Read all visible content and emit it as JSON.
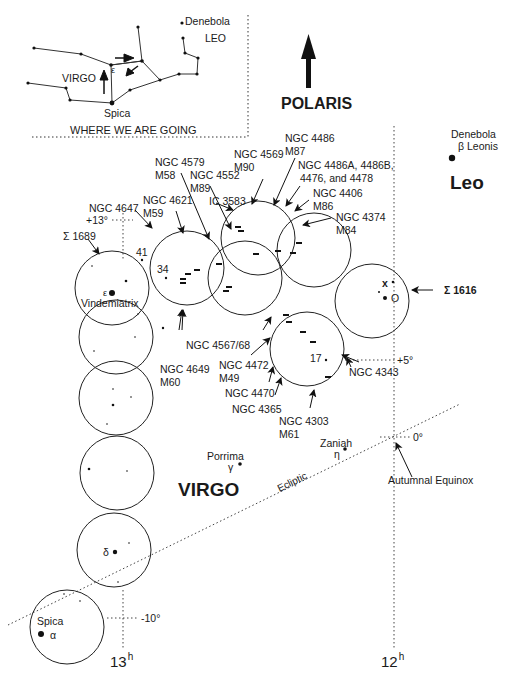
{
  "inset": {
    "title": "WHERE WE ARE GOING",
    "virgo_label": "VIRGO",
    "leo_label": "LEO",
    "denebola_label": "Denebola",
    "spica_label": "Spica",
    "epsilon_label": "ε"
  },
  "direction": {
    "label": "POLARIS"
  },
  "constellations": {
    "leo": "Leo",
    "virgo": "VIRGO"
  },
  "stars": {
    "denebola": {
      "name": "Denebola",
      "designation": "β Leonis"
    },
    "vindemiatrix": {
      "name": "Vindemiatrix",
      "greek": "ε"
    },
    "porrima": {
      "name": "Porrima",
      "greek": "γ"
    },
    "zaniah": {
      "name": "Zaniah",
      "greek": "η"
    },
    "delta": {
      "greek": "δ"
    },
    "spica": {
      "name": "Spica",
      "greek": "α"
    }
  },
  "objects": [
    {
      "id": "ngc4486",
      "line1": "NGC 4486",
      "line2": "M87"
    },
    {
      "id": "ngc4569",
      "line1": "NGC 4569",
      "line2": "M90"
    },
    {
      "id": "ngc4579",
      "line1": "NGC 4579",
      "line2": "M58"
    },
    {
      "id": "ngc4552",
      "line1": "NGC 4552",
      "line2": "M89"
    },
    {
      "id": "ngc4486a",
      "line1": "NGC 4486A, 4486B,",
      "line2": "4476, and 4478"
    },
    {
      "id": "ngc4406",
      "line1": "NGC 4406",
      "line2": "M86"
    },
    {
      "id": "ngc4621",
      "line1": "NGC 4621",
      "line2": "M59"
    },
    {
      "id": "ic3583",
      "line1": "IC 3583",
      "line2": ""
    },
    {
      "id": "ngc4374",
      "line1": "NGC 4374",
      "line2": "M84"
    },
    {
      "id": "ngc4647",
      "line1": "NGC 4647",
      "line2": ""
    },
    {
      "id": "sigma1689",
      "line1": "Σ 1689",
      "line2": ""
    },
    {
      "id": "sigma1616",
      "line1": "Σ 1616",
      "line2": ""
    },
    {
      "id": "ngc4567",
      "line1": "NGC 4567/68",
      "line2": ""
    },
    {
      "id": "ngc4649",
      "line1": "NGC 4649",
      "line2": "M60"
    },
    {
      "id": "ngc4472",
      "line1": "NGC 4472",
      "line2": "M49"
    },
    {
      "id": "ngc4470",
      "line1": "NGC 4470",
      "line2": ""
    },
    {
      "id": "ngc4365",
      "line1": "NGC 4365",
      "line2": ""
    },
    {
      "id": "ngc4303",
      "line1": "NGC 4303",
      "line2": "M61"
    },
    {
      "id": "ngc4343",
      "line1": "NGC 4343",
      "line2": ""
    }
  ],
  "star_numbers": {
    "n41": "41",
    "n34": "34",
    "n17": "17",
    "x": "x",
    "o": "O"
  },
  "grid": {
    "dec_plus13": "+13°",
    "dec_plus5": "+5°",
    "dec_0": "0°",
    "dec_minus10": "-10°",
    "ra_13": "13",
    "ra_12": "12",
    "ra_unit": "h",
    "ecliptic": "Ecliptic",
    "autumnal_equinox": "Autumnal Equinox"
  }
}
